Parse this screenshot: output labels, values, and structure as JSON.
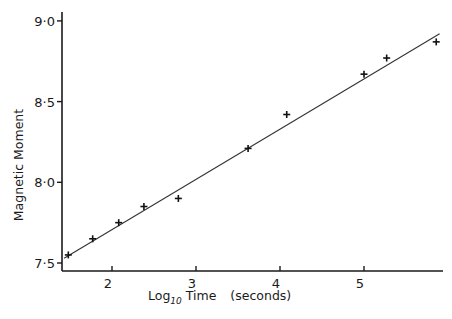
{
  "chart_data": {
    "type": "scatter",
    "title": "",
    "xlabel": "Log10 Time (seconds)",
    "xlabel_parts": {
      "main": "Log",
      "sub": "10",
      "rest": " Time",
      "units": "(seconds)"
    },
    "ylabel": "Magnetic Moment",
    "xlim": [
      1.4,
      6.0
    ],
    "ylim": [
      7.45,
      9.05
    ],
    "grid": false,
    "legend": null,
    "x_ticks": [
      2,
      3,
      4,
      5
    ],
    "x_tick_labels": [
      "2",
      "3",
      "4",
      "5"
    ],
    "y_ticks": [
      7.5,
      8.0,
      8.5,
      9.0
    ],
    "y_tick_labels": [
      "7·5",
      "8·0",
      "8·5",
      "9·0"
    ],
    "series": [
      {
        "name": "measured",
        "marker": "plus",
        "x": [
          1.48,
          1.77,
          2.08,
          2.38,
          2.79,
          3.62,
          4.08,
          5.0,
          5.27,
          5.86
        ],
        "y": [
          7.55,
          7.65,
          7.75,
          7.85,
          7.9,
          8.21,
          8.42,
          8.67,
          8.77,
          8.87
        ]
      },
      {
        "name": "fitted line",
        "style": "line",
        "x": [
          1.43,
          5.9
        ],
        "y": [
          7.53,
          8.92
        ]
      }
    ]
  }
}
